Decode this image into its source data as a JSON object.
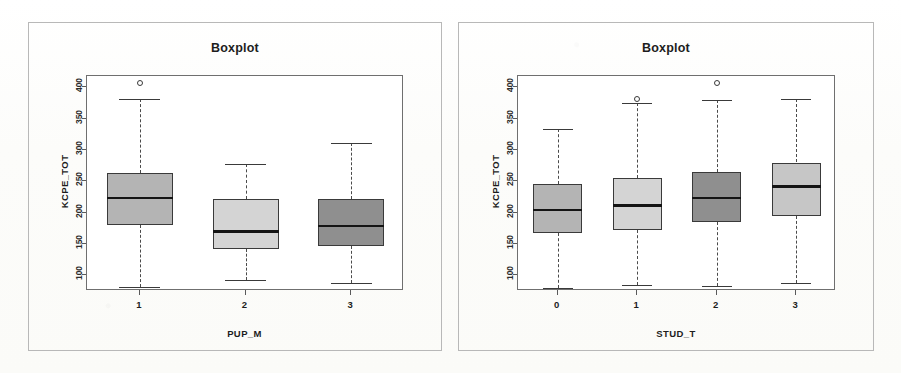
{
  "figure": {
    "background_color": "#fdfdfb",
    "panel_border_color": "#b8b8b8",
    "axis_color": "#5a5a5a"
  },
  "chart_data": [
    {
      "id": "left",
      "type": "box",
      "title": "Boxplot",
      "xlabel": "PUP_M",
      "ylabel": "KCPE_TOT",
      "ylim": [
        75,
        418
      ],
      "yticks": [
        100,
        150,
        200,
        250,
        300,
        350,
        400
      ],
      "ytick_labels": [
        "100",
        "150",
        "200",
        "250",
        "300",
        "350",
        "400"
      ],
      "grid": false,
      "legend": "none",
      "categories": [
        "1",
        "2",
        "3"
      ],
      "boxes": [
        {
          "category": "1",
          "whisker_low": 82,
          "q1": 180,
          "median": 224,
          "q3": 263,
          "whisker_high": 381,
          "outliers": [
            407
          ],
          "fill": "#b4b4b4"
        },
        {
          "category": "2",
          "whisker_low": 93,
          "q1": 142,
          "median": 170,
          "q3": 221,
          "whisker_high": 278,
          "outliers": [],
          "fill": "#d4d4d4"
        },
        {
          "category": "3",
          "whisker_low": 88,
          "q1": 147,
          "median": 179,
          "q3": 221,
          "whisker_high": 311,
          "outliers": [],
          "fill": "#8f8f8f"
        }
      ]
    },
    {
      "id": "right",
      "type": "box",
      "title": "Boxplot",
      "xlabel": "STUD_T",
      "ylabel": "KCPE_TOT",
      "ylim": [
        75,
        418
      ],
      "yticks": [
        100,
        150,
        200,
        250,
        300,
        350,
        400
      ],
      "ytick_labels": [
        "100",
        "150",
        "200",
        "250",
        "300",
        "350",
        "400"
      ],
      "grid": false,
      "legend": "none",
      "categories": [
        "0",
        "1",
        "2",
        "3"
      ],
      "boxes": [
        {
          "category": "0",
          "whisker_low": 80,
          "q1": 167,
          "median": 205,
          "q3": 245,
          "whisker_high": 334,
          "outliers": [],
          "fill": "#b4b4b4"
        },
        {
          "category": "1",
          "whisker_low": 84,
          "q1": 172,
          "median": 212,
          "q3": 255,
          "whisker_high": 375,
          "outliers": [
            382
          ],
          "fill": "#d4d4d4"
        },
        {
          "category": "2",
          "whisker_low": 83,
          "q1": 185,
          "median": 224,
          "q3": 265,
          "whisker_high": 380,
          "outliers": [
            407
          ],
          "fill": "#8f8f8f"
        },
        {
          "category": "3",
          "whisker_low": 88,
          "q1": 195,
          "median": 242,
          "q3": 280,
          "whisker_high": 381,
          "outliers": [],
          "fill": "#c6c6c6"
        }
      ]
    }
  ]
}
